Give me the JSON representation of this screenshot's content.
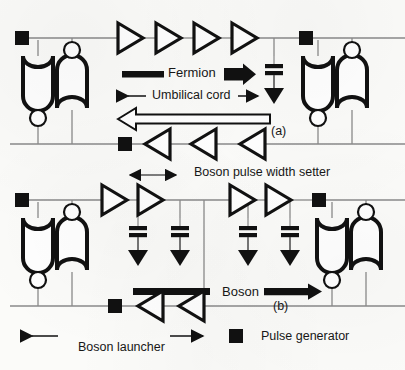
{
  "figure": {
    "background_color": "#fbfbf9",
    "ink_color": "#111111",
    "wire_color": "#8a8a8a"
  },
  "panels": [
    {
      "id": "a",
      "label": "(a)"
    },
    {
      "id": "b",
      "label": "(b)"
    }
  ],
  "annotations": {
    "fermion": "Fermion",
    "umbilical_cord": "Umbilical cord",
    "boson_pulse_width_setter": "Boson pulse width setter",
    "boson": "Boson",
    "boson_launcher": "Boson launcher",
    "panel_a": "(a)",
    "panel_b": "(b)"
  },
  "legend": {
    "items": [
      {
        "symbol": "filled-square",
        "label": "Pulse generator"
      }
    ]
  },
  "symbols": {
    "pulse_generator": "filled-square",
    "buffer_right": "right-pointing-triangle",
    "buffer_left": "left-pointing-triangle",
    "capacitor": "two-parallel-bars",
    "ground": "filled-down-triangle",
    "nand_gate": "u-shaped-gate-with-bubble",
    "nor_gate": "dome-shaped-gate-with-bubble",
    "hollow_arrow_left": "large-outline-left-arrow",
    "thick_bar": "solid-horizontal-bar",
    "solid_arrow_right": "solid-right-arrow",
    "double_headed_arrow": "double-headed-horizontal-arrow"
  },
  "counts": {
    "panel_a_buffers_right": 4,
    "panel_a_buffers_left": 3,
    "panel_a_pulse_generators": 3,
    "panel_a_capacitor_ground": 1,
    "panel_b_buffers_right": 4,
    "panel_b_buffers_left": 2,
    "panel_b_pulse_generators": 3,
    "panel_b_capacitor_ground": 4
  }
}
